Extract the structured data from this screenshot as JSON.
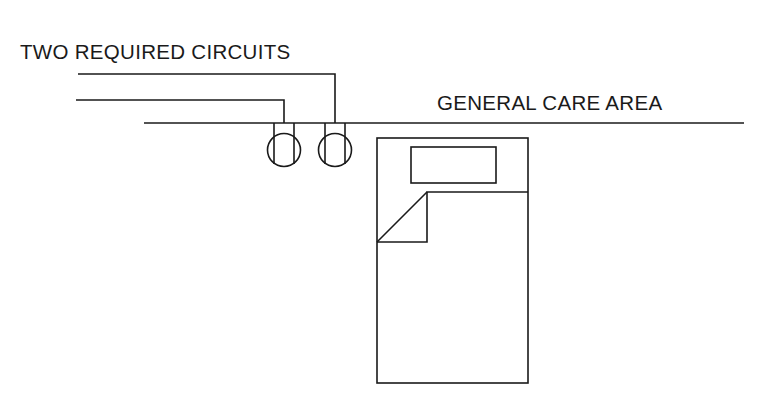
{
  "diagram": {
    "title": "TWO REQUIRED CIRCUITS",
    "area_label": "GENERAL CARE AREA",
    "elements": {
      "circuits": [
        {
          "name": "circuit-1",
          "feeds": "receptacle-right"
        },
        {
          "name": "circuit-2",
          "feeds": "receptacle-left"
        }
      ],
      "receptacles": [
        {
          "name": "receptacle-left"
        },
        {
          "name": "receptacle-right"
        }
      ],
      "bed": {
        "name": "patient-bed"
      }
    },
    "colors": {
      "line": "#1a1a1a",
      "background": "#ffffff"
    }
  }
}
